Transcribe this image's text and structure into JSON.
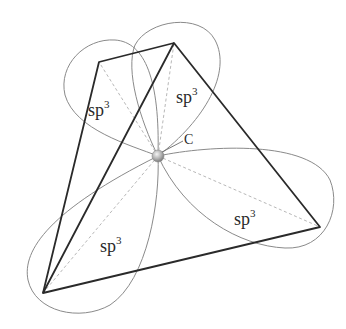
{
  "diagram": {
    "center_atom_label": "C",
    "orbital_labels": [
      {
        "base": "sp",
        "sup": "3",
        "position": "upper-left"
      },
      {
        "base": "sp",
        "sup": "3",
        "position": "upper-right"
      },
      {
        "base": "sp",
        "sup": "3",
        "position": "lower-left"
      },
      {
        "base": "sp",
        "sup": "3",
        "position": "lower-right"
      }
    ],
    "vertices": {
      "top_left": [
        99,
        62
      ],
      "top": [
        174,
        43
      ],
      "bottom_left": [
        43,
        293
      ],
      "right": [
        320,
        227
      ],
      "center": [
        158,
        156
      ]
    },
    "colors": {
      "edge": "#2a2a2a",
      "lobe": "#8a8a8a",
      "dash": "#b8b8b8",
      "atom": "#9a9a9a"
    }
  }
}
